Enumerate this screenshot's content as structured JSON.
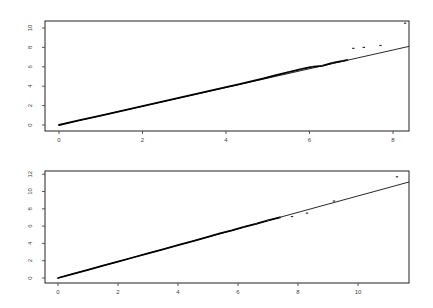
{
  "chart_data": [
    {
      "type": "scatter",
      "title": "",
      "xlabel": "",
      "ylabel": "",
      "xlim": [
        -0.2,
        8.4
      ],
      "ylim": [
        -0.4,
        11
      ],
      "x_ticks": [
        0,
        2,
        4,
        6,
        8
      ],
      "y_ticks": [
        0,
        2,
        4,
        6,
        8,
        10
      ],
      "grid": false,
      "reference_line": {
        "x": [
          0,
          8.38
        ],
        "y": [
          0,
          8.1
        ]
      },
      "series": [
        {
          "name": "sample quantiles",
          "points": [
            [
              0,
              0
            ],
            [
              0.5,
              0.5
            ],
            [
              1,
              0.97
            ],
            [
              1.5,
              1.46
            ],
            [
              2,
              1.95
            ],
            [
              2.5,
              2.44
            ],
            [
              3,
              2.93
            ],
            [
              3.5,
              3.42
            ],
            [
              4,
              3.9
            ],
            [
              4.3,
              4.2
            ],
            [
              4.6,
              4.5
            ],
            [
              4.9,
              4.8
            ],
            [
              5.2,
              5.15
            ],
            [
              5.5,
              5.45
            ],
            [
              5.8,
              5.75
            ],
            [
              6.05,
              6.0
            ],
            [
              6.3,
              6.1
            ],
            [
              6.55,
              6.4
            ],
            [
              6.8,
              6.6
            ],
            [
              6.9,
              6.7
            ],
            [
              7.05,
              7.9
            ],
            [
              7.3,
              8.0
            ],
            [
              7.7,
              8.2
            ],
            [
              8.29,
              10.5
            ]
          ]
        }
      ]
    },
    {
      "type": "scatter",
      "title": "",
      "xlabel": "",
      "ylabel": "",
      "xlim": [
        -0.2,
        11.7
      ],
      "ylim": [
        -0.4,
        12.2
      ],
      "x_ticks": [
        0,
        2,
        4,
        6,
        8,
        10
      ],
      "y_ticks": [
        0,
        2,
        4,
        6,
        8,
        10,
        12
      ],
      "grid": false,
      "reference_line": {
        "x": [
          0,
          11.7
        ],
        "y": [
          0,
          11.1
        ]
      },
      "series": [
        {
          "name": "sample quantiles",
          "points": [
            [
              0,
              0
            ],
            [
              0.5,
              0.48
            ],
            [
              1,
              0.95
            ],
            [
              1.5,
              1.42
            ],
            [
              2,
              1.9
            ],
            [
              2.5,
              2.37
            ],
            [
              3,
              2.85
            ],
            [
              3.5,
              3.32
            ],
            [
              4,
              3.8
            ],
            [
              4.5,
              4.27
            ],
            [
              5,
              4.75
            ],
            [
              5.4,
              5.15
            ],
            [
              5.8,
              5.5
            ],
            [
              6.2,
              5.9
            ],
            [
              6.6,
              6.25
            ],
            [
              7,
              6.65
            ],
            [
              7.4,
              7.0
            ],
            [
              7.8,
              7.1
            ],
            [
              8.3,
              7.5
            ],
            [
              9.2,
              8.9
            ],
            [
              11.3,
              11.7
            ]
          ]
        }
      ]
    }
  ],
  "plots": [
    {
      "x_tick_labels": [
        "0",
        "2",
        "4",
        "6",
        "8"
      ],
      "y_tick_labels": [
        "0",
        "2",
        "4",
        "6",
        "8",
        "10"
      ]
    },
    {
      "x_tick_labels": [
        "0",
        "2",
        "4",
        "6",
        "8",
        "10"
      ],
      "y_tick_labels": [
        "0",
        "2",
        "4",
        "6",
        "8",
        "10",
        "12"
      ]
    }
  ]
}
